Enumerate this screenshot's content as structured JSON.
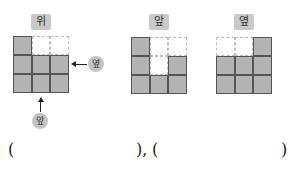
{
  "views": [
    {
      "label": "위",
      "cells": [
        [
          1,
          0,
          0
        ],
        [
          1,
          1,
          1
        ],
        [
          1,
          1,
          1
        ]
      ]
    },
    {
      "label": "앞",
      "cells": [
        [
          1,
          0,
          0
        ],
        [
          1,
          0,
          1
        ],
        [
          1,
          1,
          1
        ]
      ]
    },
    {
      "label": "옆",
      "cells": [
        [
          0,
          0,
          1
        ],
        [
          1,
          1,
          1
        ],
        [
          1,
          1,
          1
        ]
      ]
    }
  ],
  "direction_labels": {
    "side": "옆",
    "front": "앞"
  },
  "answer_blanks": {
    "open1": "(",
    "close1": "),",
    "open2": "(",
    "close2": ")"
  },
  "colors": {
    "filled": "#b3b3b3",
    "label_bg": "#c9c9c9"
  }
}
